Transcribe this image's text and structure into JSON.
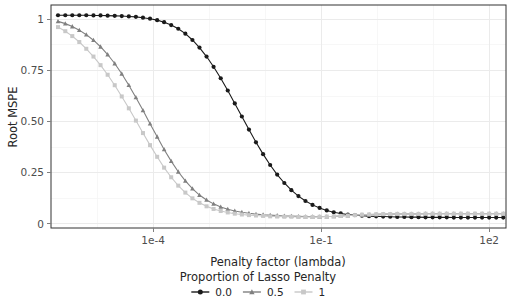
{
  "chart_data": {
    "type": "line",
    "title": "",
    "xlabel": "Penalty factor (lambda)",
    "ylabel": "Root MSPE",
    "x_scale": "log10",
    "xlim": [
      1.5e-06,
      200
    ],
    "ylim": [
      -0.02,
      1.07
    ],
    "grid": true,
    "x_tick_labels": [
      "1e-4",
      "1e-1",
      "1e2"
    ],
    "x_tick_values": [
      0.0001,
      0.1,
      100
    ],
    "x_minor_tick_values": [
      1e-07,
      0.0001,
      0.1,
      100
    ],
    "y_tick_labels": [
      "0",
      "0.25",
      "0.50",
      "0.75",
      "1"
    ],
    "y_tick_values": [
      0,
      0.25,
      0.5,
      0.75,
      1
    ],
    "legend_title": "Proportion of Lasso Penalty",
    "legend_position": "bottom",
    "legend_entries": [
      {
        "label": "0.0",
        "color": "#1a1a1a",
        "marker": "circle"
      },
      {
        "label": "0.5",
        "color": "#808080",
        "marker": "triangle"
      },
      {
        "label": "1",
        "color": "#c8c8c8",
        "marker": "square"
      }
    ],
    "series": [
      {
        "name": "0.0",
        "color": "#1a1a1a",
        "marker": "circle",
        "x": [
          2e-06,
          2.7e-06,
          3.6e-06,
          4.8e-06,
          6.4e-06,
          8.6e-06,
          1.15e-05,
          1.54e-05,
          2.06e-05,
          2.75e-05,
          3.68e-05,
          4.92e-05,
          6.58e-05,
          8.8e-05,
          0.000118,
          0.000157,
          0.00021,
          0.000281,
          0.000376,
          0.000503,
          0.000672,
          0.000899,
          0.0012,
          0.00161,
          0.00215,
          0.00287,
          0.00384,
          0.00514,
          0.00687,
          0.00919,
          0.0123,
          0.0164,
          0.022,
          0.0294,
          0.0393,
          0.0525,
          0.0702,
          0.0939,
          0.126,
          0.168,
          0.224,
          0.3,
          0.401,
          0.536,
          0.717,
          0.959,
          1.28,
          1.71,
          2.29,
          3.06,
          4.1,
          5.48,
          7.32,
          9.79,
          13.1,
          17.5,
          23.4,
          31.3,
          41.8,
          55.9,
          74.8,
          100.0,
          133.7,
          178.8
        ],
        "y": [
          1.02,
          1.02,
          1.02,
          1.02,
          1.02,
          1.019,
          1.019,
          1.018,
          1.017,
          1.016,
          1.014,
          1.012,
          1.008,
          1.003,
          0.996,
          0.986,
          0.972,
          0.954,
          0.93,
          0.899,
          0.862,
          0.818,
          0.768,
          0.712,
          0.652,
          0.589,
          0.525,
          0.461,
          0.399,
          0.341,
          0.288,
          0.241,
          0.2,
          0.165,
          0.136,
          0.112,
          0.093,
          0.078,
          0.066,
          0.057,
          0.051,
          0.046,
          0.043,
          0.04,
          0.038,
          0.037,
          0.036,
          0.035,
          0.034,
          0.034,
          0.033,
          0.033,
          0.032,
          0.032,
          0.032,
          0.032,
          0.031,
          0.031,
          0.031,
          0.031,
          0.031,
          0.031,
          0.031,
          0.031
        ]
      },
      {
        "name": "0.5",
        "color": "#808080",
        "marker": "triangle",
        "x": [
          2e-06,
          2.7e-06,
          3.6e-06,
          4.8e-06,
          6.4e-06,
          8.6e-06,
          1.15e-05,
          1.54e-05,
          2.06e-05,
          2.75e-05,
          3.68e-05,
          4.92e-05,
          6.58e-05,
          8.8e-05,
          0.000118,
          0.000157,
          0.00021,
          0.000281,
          0.000376,
          0.000503,
          0.000672,
          0.000899,
          0.0012,
          0.00161,
          0.00215,
          0.00287,
          0.00384,
          0.00514,
          0.00687,
          0.00919,
          0.0123,
          0.0164,
          0.022,
          0.0294,
          0.0393,
          0.0525,
          0.0702,
          0.0939,
          0.126,
          0.168,
          0.224,
          0.3,
          0.401,
          0.536,
          0.717,
          0.959,
          1.28,
          1.71,
          2.29,
          3.06,
          4.1,
          5.48,
          7.32,
          9.79,
          13.1,
          17.5,
          23.4,
          31.3,
          41.8,
          55.9,
          74.8,
          100.0,
          133.7,
          178.8
        ],
        "y": [
          0.99,
          0.979,
          0.965,
          0.947,
          0.925,
          0.898,
          0.866,
          0.828,
          0.784,
          0.734,
          0.678,
          0.618,
          0.555,
          0.49,
          0.426,
          0.364,
          0.307,
          0.255,
          0.21,
          0.172,
          0.141,
          0.117,
          0.098,
          0.083,
          0.072,
          0.063,
          0.057,
          0.052,
          0.048,
          0.045,
          0.043,
          0.041,
          0.039,
          0.038,
          0.037,
          0.036,
          0.035,
          0.035,
          0.036,
          0.037,
          0.039,
          0.041,
          0.043,
          0.045,
          0.046,
          0.047,
          0.048,
          0.048,
          0.049,
          0.049,
          0.049,
          0.049,
          0.05,
          0.05,
          0.05,
          0.05,
          0.05,
          0.05,
          0.05,
          0.05,
          0.05,
          0.05,
          0.05,
          0.05
        ]
      },
      {
        "name": "1",
        "color": "#c8c8c8",
        "marker": "square",
        "x": [
          2e-06,
          2.7e-06,
          3.6e-06,
          4.8e-06,
          6.4e-06,
          8.6e-06,
          1.15e-05,
          1.54e-05,
          2.06e-05,
          2.75e-05,
          3.68e-05,
          4.92e-05,
          6.58e-05,
          8.8e-05,
          0.000118,
          0.000157,
          0.00021,
          0.000281,
          0.000376,
          0.000503,
          0.000672,
          0.000899,
          0.0012,
          0.00161,
          0.00215,
          0.00287,
          0.00384,
          0.00514,
          0.00687,
          0.00919,
          0.0123,
          0.0164,
          0.022,
          0.0294,
          0.0393,
          0.0525,
          0.0702,
          0.0939,
          0.126,
          0.168,
          0.224,
          0.3,
          0.401,
          0.536,
          0.717,
          0.959,
          1.28,
          1.71,
          2.29,
          3.06,
          4.1,
          5.48,
          7.32,
          9.79,
          13.1,
          17.5,
          23.4,
          31.3,
          41.8,
          55.9,
          74.8,
          100.0,
          133.7,
          178.8
        ],
        "y": [
          0.962,
          0.942,
          0.918,
          0.889,
          0.856,
          0.818,
          0.776,
          0.729,
          0.678,
          0.623,
          0.565,
          0.505,
          0.444,
          0.385,
          0.328,
          0.275,
          0.228,
          0.187,
          0.153,
          0.125,
          0.103,
          0.086,
          0.073,
          0.063,
          0.056,
          0.05,
          0.046,
          0.043,
          0.041,
          0.039,
          0.037,
          0.036,
          0.035,
          0.035,
          0.034,
          0.034,
          0.034,
          0.035,
          0.036,
          0.037,
          0.039,
          0.041,
          0.043,
          0.045,
          0.046,
          0.047,
          0.048,
          0.048,
          0.049,
          0.049,
          0.049,
          0.049,
          0.05,
          0.05,
          0.05,
          0.05,
          0.05,
          0.05,
          0.05,
          0.05,
          0.05,
          0.05,
          0.05,
          0.05
        ]
      }
    ]
  },
  "axes": {
    "y_title": "Root MSPE",
    "x_title": "Penalty factor (lambda)"
  },
  "legend": {
    "title": "Proportion of Lasso Penalty"
  }
}
